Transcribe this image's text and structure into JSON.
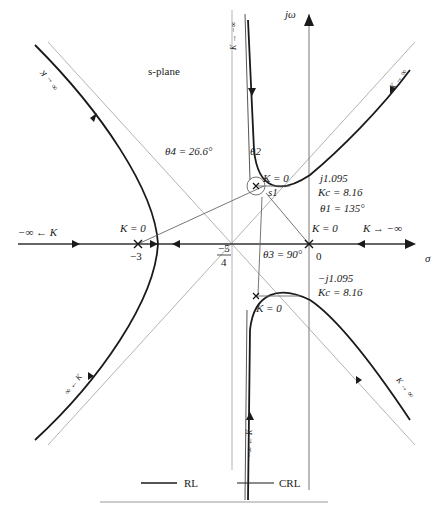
{
  "diagram": {
    "plane_label": "s-plane",
    "axes": {
      "imag_label": "jω",
      "real_label": "σ",
      "origin_label": "0"
    },
    "poles": [
      {
        "label": "−3",
        "k_label": "K = 0"
      },
      {
        "label": "0",
        "k_label": "K = 0"
      },
      {
        "label": "s1",
        "k_label": "K = 0"
      },
      {
        "label": "s1*",
        "k_label": "K = 0"
      }
    ],
    "centroid_label_num": "−5",
    "centroid_label_den": "4",
    "upper_crossing": {
      "freq": "j1.095",
      "gain": "Kc = 8.16"
    },
    "lower_crossing": {
      "freq": "−j1.095",
      "gain": "Kc = 8.16"
    },
    "angles": {
      "theta1": "θ1 = 135°",
      "theta2": "θ2",
      "theta3": "θ3 = 90°",
      "theta4": "θ4 = 26.6°"
    },
    "pole_s1_label": "s1",
    "branch_labels": {
      "top_vertical": "K → −∞",
      "upper_left": "∞ ← K",
      "upper_right": "K → ∞",
      "lower_left": "∞ ← K",
      "lower_right": "K → ∞",
      "bottom_vertical": "−∞ ← K",
      "left_axis": "−∞ ← K",
      "right_axis": "K → −∞"
    },
    "legend": [
      {
        "label": "RL"
      },
      {
        "label": "CRL"
      }
    ]
  }
}
